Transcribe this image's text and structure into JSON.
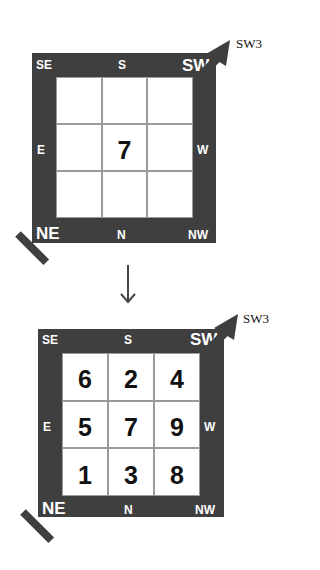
{
  "colors": {
    "frame": "#3f3f3f",
    "grid_line": "#9a9a9a",
    "text": "#111111"
  },
  "diagram_before": {
    "corner_labels": {
      "top_left": "SE",
      "top_center": "S",
      "top_right": "SW",
      "middle_left": "E",
      "middle_right": "W",
      "bottom_left": "NE",
      "bottom_center": "N",
      "bottom_right": "NW"
    },
    "pointer_label": "SW3",
    "grid": [
      [
        "",
        "",
        ""
      ],
      [
        "",
        "7",
        ""
      ],
      [
        "",
        "",
        ""
      ]
    ]
  },
  "transition_arrow": "down-arrow-icon",
  "diagram_after": {
    "corner_labels": {
      "top_left": "SE",
      "top_center": "S",
      "top_right": "SW",
      "middle_left": "E",
      "middle_right": "W",
      "bottom_left": "NE",
      "bottom_center": "N",
      "bottom_right": "NW"
    },
    "pointer_label": "SW3",
    "grid": [
      [
        "6",
        "2",
        "4"
      ],
      [
        "5",
        "7",
        "9"
      ],
      [
        "1",
        "3",
        "8"
      ]
    ]
  }
}
